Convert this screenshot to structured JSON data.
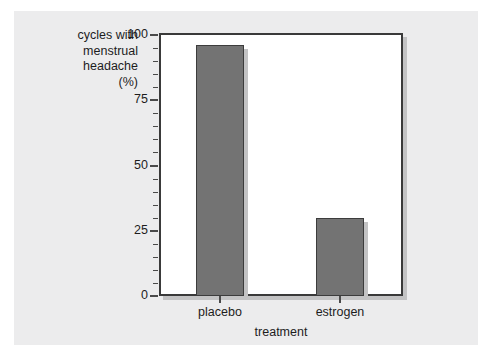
{
  "chart_data": {
    "type": "bar",
    "title": "",
    "categories": [
      "placebo",
      "estrogen"
    ],
    "values": [
      96,
      30
    ],
    "xlabel": "treatment",
    "ylabel": "cycles with menstrual headache (%)",
    "ylabel_lines": [
      "cycles with",
      "menstrual",
      "headache",
      "(%)"
    ],
    "ylim": [
      0,
      100
    ],
    "yticks": [
      0,
      25,
      50,
      75,
      100
    ],
    "ytick_labels": [
      "0",
      "25",
      "50",
      "75",
      "100"
    ],
    "yminor_step": 5,
    "grid": false,
    "legend": null,
    "bar_color": "#737373",
    "bar_edge_color": "#3c3c3c",
    "plot_background": "#ffffff",
    "panel_background": "#ececed",
    "axis_color": "#3a3a3a",
    "shadow_color": "#c3c3c4"
  }
}
